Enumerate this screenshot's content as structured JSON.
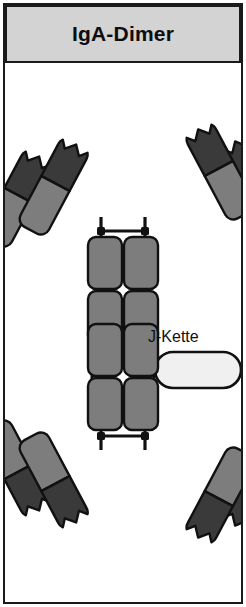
{
  "header": {
    "title": "IgA-Dimer"
  },
  "diagram": {
    "name": "iga-dimer-schematic",
    "labels": [
      {
        "id": "j-chain",
        "text": "J-Kette"
      }
    ],
    "colors": {
      "variable_domain": "#3a3a3a",
      "constant_domain": "#7d7d7d",
      "j_chain_fill": "#f0f0f0",
      "outline": "#111111",
      "header_bg": "#d3d3d3",
      "frame_border": "#1a1a1a",
      "background": "#ffffff"
    },
    "structure": {
      "monomers": 2,
      "fab_arms_per_monomer": 4,
      "antigen_binding_notches": 8,
      "fc_domains_per_monomer": 4,
      "j_chain_count": 1
    }
  }
}
